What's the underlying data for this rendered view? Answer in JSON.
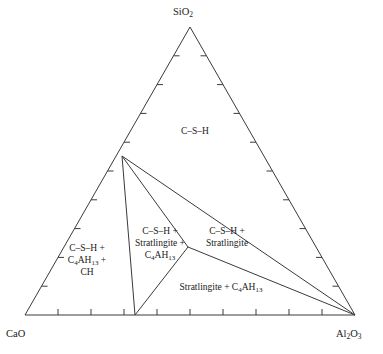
{
  "figure": {
    "type": "ternary-phase-diagram",
    "corners": {
      "top": {
        "name": "SiO2",
        "main": "SiO",
        "sub": "2"
      },
      "left": {
        "name": "CaO",
        "main": "CaO",
        "sub": ""
      },
      "right": {
        "name": "Al2O3",
        "main": "Al",
        "sub": "2",
        "main2": "O",
        "sub2": "3"
      }
    },
    "fields": [
      {
        "id": "csh",
        "lines": [
          "C–S–H"
        ]
      },
      {
        "id": "left",
        "lines": [
          "C–S–H +",
          "C4AH13 +",
          "CH"
        ]
      },
      {
        "id": "mid",
        "lines": [
          "C–S–H +",
          "Stratlingite +",
          "C4AH13"
        ]
      },
      {
        "id": "right",
        "lines": [
          "C–S–H +",
          "Stratlingite"
        ]
      },
      {
        "id": "bottom",
        "lines": [
          "Stratlingite + C4AH13"
        ]
      }
    ],
    "axis": {
      "ticks_per_edge": 9,
      "divisions": 10
    },
    "colors": {
      "line": "#3a3a3a",
      "text": "#1a1a1a",
      "background": "#ffffff"
    }
  },
  "chart_data": {
    "type": "scatter",
    "title": "",
    "xlabel": "",
    "ylabel": "",
    "subtype": "ternary phase diagram",
    "components": [
      "CaO",
      "SiO2",
      "Al2O3"
    ],
    "axis_ticks": 9,
    "vertices": {
      "SiO2": [
        190,
        27
      ],
      "CaO": [
        25,
        315
      ],
      "Al2O3": [
        355,
        315
      ]
    },
    "nodes": [
      {
        "name": "left-edge-junction",
        "x": 122,
        "y": 156
      },
      {
        "name": "stratlingite-junction",
        "x": 188,
        "y": 247
      },
      {
        "name": "base-junction",
        "x": 135,
        "y": 315
      }
    ],
    "tie_lines": [
      {
        "from": "left-edge-junction",
        "to": "base-junction"
      },
      {
        "from": "left-edge-junction",
        "to": "stratlingite-junction"
      },
      {
        "from": "left-edge-junction",
        "to": "Al2O3"
      },
      {
        "from": "stratlingite-junction",
        "to": "base-junction"
      },
      {
        "from": "stratlingite-junction",
        "to": "Al2O3"
      }
    ],
    "regions": [
      {
        "label": "C–S–H",
        "phases": [
          "C-S-H"
        ]
      },
      {
        "label": "C–S–H + C4AH13 + CH",
        "phases": [
          "C-S-H",
          "C4AH13",
          "CH"
        ]
      },
      {
        "label": "C–S–H + Stratlingite + C4AH13",
        "phases": [
          "C-S-H",
          "Stratlingite",
          "C4AH13"
        ]
      },
      {
        "label": "C–S–H + Stratlingite",
        "phases": [
          "C-S-H",
          "Stratlingite"
        ]
      },
      {
        "label": "Stratlingite + C4AH13",
        "phases": [
          "Stratlingite",
          "C4AH13"
        ]
      }
    ]
  }
}
